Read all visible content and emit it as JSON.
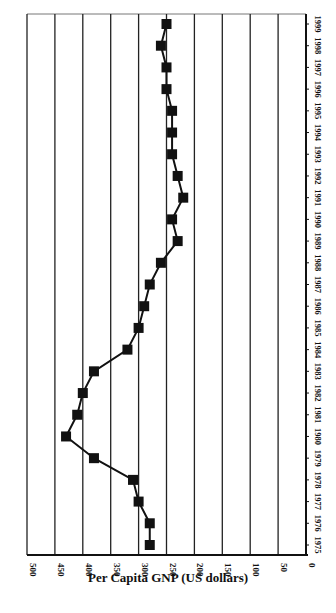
{
  "chart_data": {
    "type": "line",
    "orientation": "rotated-90",
    "title": "",
    "xlabel": "Per Capita GNP (US dollars)",
    "ylabel": "",
    "value_axis": {
      "min": 0,
      "max": 500,
      "step": 50,
      "reversed": true,
      "ticks": [
        "500",
        "450",
        "400",
        "350",
        "300",
        "250",
        "200",
        "150",
        "100",
        "50",
        "0"
      ]
    },
    "category_axis": {
      "position": "right"
    },
    "grid": true,
    "marker": "square",
    "line_color": "#111111",
    "categories": [
      "1975",
      "1976",
      "1977",
      "1978",
      "1979",
      "1980",
      "1981",
      "1982",
      "1983",
      "1984",
      "1985",
      "1986",
      "1987",
      "1988",
      "1989",
      "1990",
      "1991",
      "1992",
      "1993",
      "1994",
      "1995",
      "1996",
      "1997",
      "1998",
      "1999"
    ],
    "series": [
      {
        "name": "Per Capita GNP",
        "values": [
          280,
          280,
          300,
          310,
          380,
          430,
          410,
          400,
          380,
          320,
          300,
          290,
          280,
          260,
          230,
          240,
          220,
          230,
          240,
          240,
          240,
          250,
          250,
          260,
          250
        ]
      }
    ]
  }
}
